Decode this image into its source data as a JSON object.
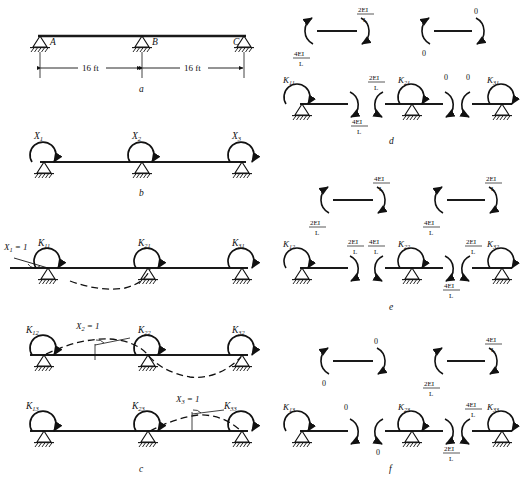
{
  "figure": {
    "panel_labels": [
      "a",
      "b",
      "c",
      "d",
      "e",
      "f"
    ]
  },
  "panel_a": {
    "caption": "a",
    "supports": [
      "A",
      "B",
      "C"
    ],
    "dimensions": [
      "16 ft",
      "16 ft"
    ]
  },
  "panel_b": {
    "caption": "b",
    "moments": [
      "X",
      "X",
      "X"
    ],
    "subscripts": [
      "1",
      "2",
      "3"
    ]
  },
  "panel_c": {
    "caption": "c",
    "rows": [
      {
        "applied": "X",
        "applied_sub": "1",
        "applied_val": "= 1",
        "k": [
          "K",
          "K",
          "K"
        ],
        "k_sub": [
          "11",
          "21",
          "31"
        ]
      },
      {
        "applied": "X",
        "applied_sub": "2",
        "applied_val": "= 1",
        "k": [
          "K",
          "K",
          "K"
        ],
        "k_sub": [
          "12",
          "22",
          "32"
        ]
      },
      {
        "applied": "X",
        "applied_sub": "3",
        "applied_val": "= 1",
        "k": [
          "K",
          "K",
          "K"
        ],
        "k_sub": [
          "13",
          "23",
          "33"
        ]
      }
    ]
  },
  "panel_d": {
    "caption": "d",
    "top_segments": [
      {
        "left_moment": {
          "num": "4EI",
          "den": "L"
        },
        "right_moment": {
          "num": "2EI",
          "den": "L"
        }
      },
      {
        "left_moment": {
          "num": "0",
          "den": ""
        },
        "right_moment": {
          "num": "0",
          "den": ""
        }
      }
    ],
    "bottom_joints": [
      {
        "k": "K",
        "k_sub": "11",
        "right_moment": {
          "num": "4EI",
          "den": "L"
        }
      },
      {
        "left_moment": {
          "num": "2EI",
          "den": "L"
        },
        "k": "K",
        "k_sub": "21",
        "right_moment": {
          "num": "0",
          "den": ""
        }
      },
      {
        "left_moment": {
          "num": "0",
          "den": ""
        },
        "k": "K",
        "k_sub": "31"
      }
    ]
  },
  "panel_e": {
    "caption": "e",
    "top_segments": [
      {
        "left_moment": {
          "num": "2EI",
          "den": "L"
        },
        "right_moment": {
          "num": "4EI",
          "den": "L"
        }
      },
      {
        "left_moment": {
          "num": "4EI",
          "den": "L"
        },
        "right_moment": {
          "num": "2EI",
          "den": "L"
        }
      }
    ],
    "bottom_joints": [
      {
        "k": "K",
        "k_sub": "12",
        "right_moment": {
          "num": "2EI",
          "den": "L"
        }
      },
      {
        "left_moment": {
          "num": "4EI",
          "den": "L"
        },
        "k": "K",
        "k_sub": "22",
        "right_moment": {
          "num": "4EI",
          "den": "L"
        }
      },
      {
        "left_moment": {
          "num": "2EI",
          "den": "L"
        },
        "k": "K",
        "k_sub": "32"
      }
    ]
  },
  "panel_f": {
    "caption": "f",
    "top_segments": [
      {
        "left_moment": {
          "num": "0",
          "den": ""
        },
        "right_moment": {
          "num": "0",
          "den": ""
        }
      },
      {
        "left_moment": {
          "num": "2EI",
          "den": "L"
        },
        "right_moment": {
          "num": "4EI",
          "den": "L"
        }
      }
    ],
    "bottom_joints": [
      {
        "k": "K",
        "k_sub": "13",
        "right_moment": {
          "num": "0",
          "den": ""
        }
      },
      {
        "left_moment": {
          "num": "0",
          "den": ""
        },
        "k": "K",
        "k_sub": "23",
        "right_moment": {
          "num": "2EI",
          "den": "L"
        }
      },
      {
        "left_moment": {
          "num": "4EI",
          "den": "L"
        },
        "k": "K",
        "k_sub": "33"
      }
    ]
  },
  "colors": {
    "ink": "#111111",
    "beam": "#1a1a1a"
  }
}
